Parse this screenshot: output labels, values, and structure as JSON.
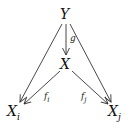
{
  "diagram": {
    "type": "commutative-diagram",
    "nodes": {
      "Y": {
        "label": "Y"
      },
      "X": {
        "label": "X"
      },
      "Xi": {
        "base": "X",
        "sub": "i"
      },
      "Xj": {
        "base": "X",
        "sub": "j"
      }
    },
    "edges": {
      "g": {
        "from": "Y",
        "to": "X",
        "base": "g",
        "sub": ""
      },
      "fi": {
        "from": "X",
        "to": "Xi",
        "base": "f",
        "sub": "i"
      },
      "fj": {
        "from": "X",
        "to": "Xj",
        "base": "f",
        "sub": "j"
      },
      "y_to_xi": {
        "from": "Y",
        "to": "Xi",
        "label": ""
      },
      "y_to_xj": {
        "from": "Y",
        "to": "Xj",
        "label": ""
      }
    },
    "colors": {
      "stroke": "#333333",
      "text": "#111111",
      "background": "#ffffff"
    }
  }
}
